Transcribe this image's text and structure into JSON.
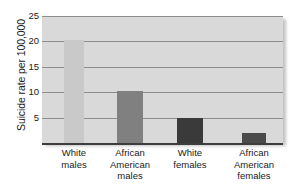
{
  "chart_data": {
    "type": "bar",
    "title": "",
    "subtitle": "",
    "xlabel": "",
    "ylabel": "Suicide rate per 100,000",
    "categories": [
      "White males",
      "African American males",
      "White females",
      "African American females"
    ],
    "category_lines": [
      [
        "White",
        "males"
      ],
      [
        "African",
        "American",
        "males"
      ],
      [
        "White",
        "females"
      ],
      [
        "African",
        "American",
        "females"
      ]
    ],
    "values": [
      20.3,
      10.3,
      5.0,
      2.0
    ],
    "bar_colors": [
      "#c9c9c9",
      "#808080",
      "#3a3a3a",
      "#4a4a4a"
    ],
    "ylim": [
      0,
      25
    ],
    "yticks": [
      5,
      10,
      15,
      20,
      25
    ],
    "ytick_labels": [
      "5",
      "10",
      "15",
      "20",
      "25"
    ],
    "grid": true,
    "grid_axis": "y",
    "legend": false,
    "legend_position": "none",
    "plot_background": "#d9d9d9",
    "gridline_color": "#8d8d8d",
    "axis_color": "#3d3d3d"
  }
}
